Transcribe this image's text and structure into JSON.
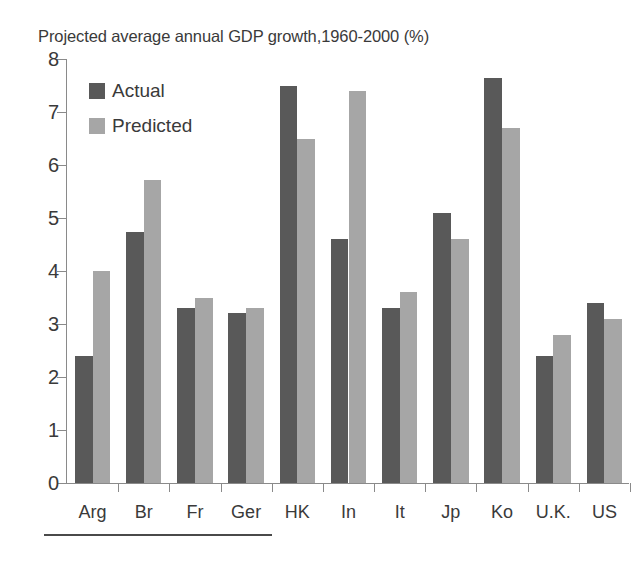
{
  "chart_data": {
    "type": "bar",
    "title": "Projected average annual GDP growth,1960-2000 (%)",
    "xlabel": "",
    "ylabel": "",
    "ylim": [
      0,
      8
    ],
    "ytick_step": 1,
    "yticks": [
      "8",
      "7",
      "6",
      "5",
      "4",
      "3",
      "2",
      "1",
      "0"
    ],
    "grid": false,
    "legend_position": "top-left-inside",
    "categories": [
      "Arg",
      "Br",
      "Fr",
      "Ger",
      "HK",
      "In",
      "It",
      "Jp",
      "Ko",
      "U.K.",
      "US"
    ],
    "series": [
      {
        "name": "Actual",
        "color": "#595959",
        "values": [
          2.4,
          4.73,
          3.3,
          3.2,
          7.5,
          4.6,
          3.3,
          5.1,
          7.65,
          2.4,
          3.4
        ]
      },
      {
        "name": "Predicted",
        "color": "#a6a6a6",
        "values": [
          4.0,
          5.72,
          3.5,
          3.3,
          6.5,
          7.4,
          3.6,
          4.6,
          6.7,
          2.8,
          3.1
        ]
      }
    ]
  },
  "style": {
    "axis_color": "#8a8a8a",
    "text_color": "#3a3a3a",
    "background": "#ffffff",
    "rule_color": "#4a4a4a"
  }
}
